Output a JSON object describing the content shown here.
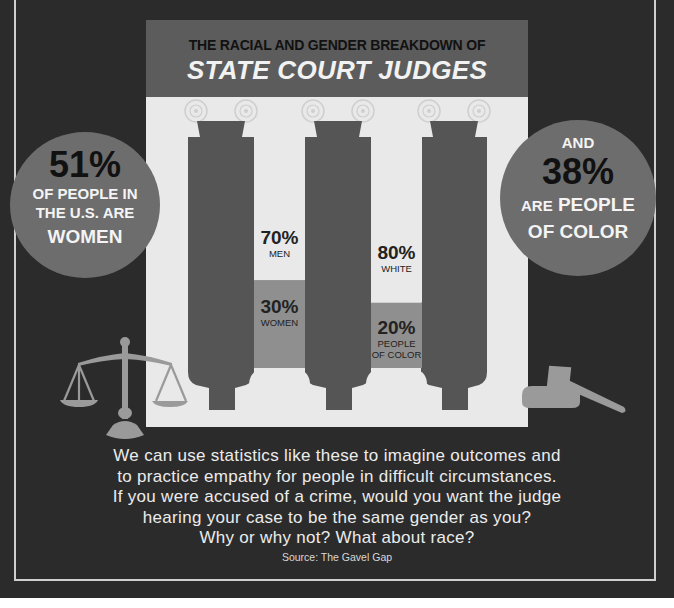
{
  "header": {
    "subtitle": "THE RACIAL AND GENDER BREAKDOWN OF",
    "title": "STATE COURT JUDGES"
  },
  "left_callout": {
    "value": "51%",
    "line1": "OF PEOPLE IN",
    "line2": "THE U.S. ARE",
    "line3": "WOMEN"
  },
  "right_callout": {
    "prefix": "AND",
    "value": "38%",
    "line1_small": "ARE",
    "line1": "PEOPLE",
    "line2": "OF COLOR"
  },
  "chart_data": {
    "type": "bar",
    "title": "THE RACIAL AND GENDER BREAKDOWN OF STATE COURT JUDGES",
    "categories": [
      "Gender",
      "Race"
    ],
    "series": [
      {
        "name": "Gender",
        "segments": [
          {
            "label": "MEN",
            "value": 70,
            "display": "70%"
          },
          {
            "label": "WOMEN",
            "value": 30,
            "display": "30%"
          }
        ]
      },
      {
        "name": "Race",
        "segments": [
          {
            "label": "WHITE",
            "value": 80,
            "display": "80%"
          },
          {
            "label": "PEOPLE OF COLOR",
            "value": 20,
            "display": "20%"
          }
        ]
      }
    ],
    "stacked": true,
    "ylim": [
      0,
      100
    ],
    "unit": "%"
  },
  "bars": [
    {
      "top_pct": "70%",
      "top_label": "MEN",
      "bottom_pct": "30%",
      "bottom_label_1": "WOMEN",
      "bottom_label_2": ""
    },
    {
      "top_pct": "80%",
      "top_label": "WHITE",
      "bottom_pct": "20%",
      "bottom_label_1": "PEOPLE",
      "bottom_label_2": "OF COLOR"
    }
  ],
  "body": {
    "lines": [
      "We can use statistics like these to imagine outcomes and",
      "to practice empathy for people in difficult circumstances.",
      "If you were accused of a crime, would you want the judge",
      "hearing your case to be the same gender as you?",
      "Why or why not? What about race?"
    ],
    "source": "Source: The Gavel Gap"
  },
  "icons": {
    "left": "scales-of-justice-icon",
    "right": "gavel-icon",
    "column_capital": "ionic-scroll-icon"
  },
  "colors": {
    "background": "#2b2b2b",
    "panel": "#e9e9e9",
    "column": "#555555",
    "highlight_bar": "#8f8f8f",
    "circle": "#6d6d6d",
    "icon": "#9a9a9a"
  }
}
